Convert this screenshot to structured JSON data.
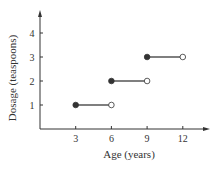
{
  "chart_data": {
    "type": "line",
    "subtype": "step",
    "title": "",
    "xlabel": "Age (years)",
    "ylabel": "Dosage (teaspoons)",
    "x_ticks": [
      "3",
      "6",
      "9",
      "12"
    ],
    "y_ticks": [
      "1",
      "2",
      "3",
      "4"
    ],
    "xlim": [
      0,
      13.5
    ],
    "ylim": [
      0,
      4.8
    ],
    "grid": false,
    "legend": null,
    "segments": [
      {
        "x_start": 3,
        "x_end": 6,
        "y": 1,
        "start": "closed",
        "end": "open"
      },
      {
        "x_start": 6,
        "x_end": 9,
        "y": 2,
        "start": "closed",
        "end": "open"
      },
      {
        "x_start": 9,
        "x_end": 12,
        "y": 3,
        "start": "closed",
        "end": "open"
      }
    ]
  },
  "colors": {
    "axis": "#333333",
    "segment": "#555555",
    "point_fill": "#333333"
  }
}
